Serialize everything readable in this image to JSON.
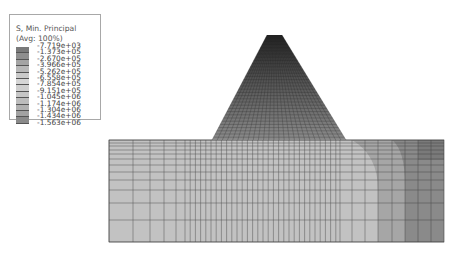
{
  "legend": {
    "title": "S, Min. Principal",
    "subtitle": "(Avg: 100%)",
    "values": [
      "-7.719e+03",
      "-1.373e+05",
      "-2.670e+05",
      "-3.966e+05",
      "-5.262e+05",
      "-6.558e+05",
      "-7.854e+05",
      "-9.151e+05",
      "-1.045e+06",
      "-1.174e+06",
      "-1.304e+06",
      "-1.434e+06",
      "-1.563e+06"
    ],
    "colors": [
      "#7a7a7a",
      "#8e8e8e",
      "#a4a4a4",
      "#b8b8b8",
      "#cacaca",
      "#d6d6d6",
      "#cfcfcf",
      "#c6c6c6",
      "#bcbcbc",
      "#b0b0b0",
      "#a2a2a2",
      "#8a8a8a",
      "#707070"
    ]
  },
  "model": {
    "name": "cone-on-block mesh contour",
    "block_colors": {
      "light": "#c2c2c2",
      "mid": "#a9a9a9",
      "dark": "#8c8c8c",
      "darkest": "#7d7d7d"
    },
    "cone_color_top": "#2e2e2e",
    "cone_color_base": "#8a8a8a",
    "mesh_line": "#3a3a3a"
  }
}
